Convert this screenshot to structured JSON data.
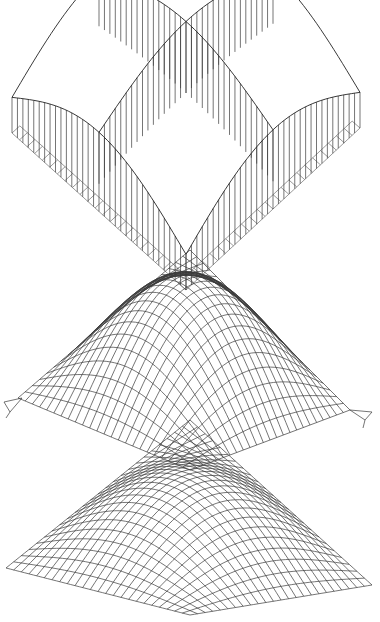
{
  "figures": [
    {
      "id": "vault-with-struts",
      "description": "Cross-vault shell with vertical struts above square ground grid",
      "grid_divisions": 16,
      "line_color": "#3a3a3a"
    },
    {
      "id": "corner-supported-net",
      "description": "Corner-supported doubly-curved net shell with pinned supports",
      "grid_divisions": 24,
      "supports": [
        "left",
        "right"
      ],
      "line_color": "#3a3a3a"
    },
    {
      "id": "corner-supported-shell",
      "description": "Corner-supported doubly-curved shell mesh",
      "grid_divisions": 24,
      "line_color": "#3a3a3a"
    }
  ]
}
